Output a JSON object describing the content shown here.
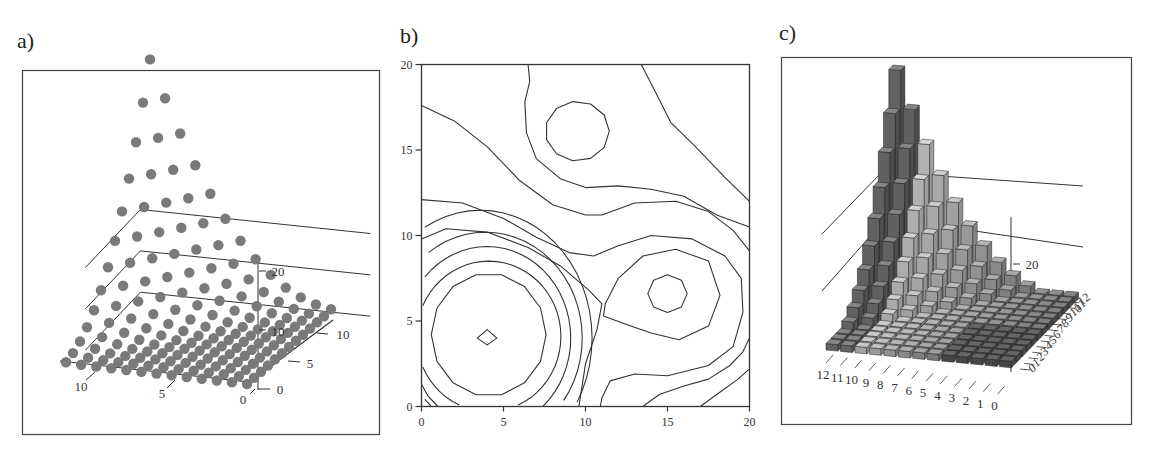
{
  "panels": {
    "a": {
      "label": "a)"
    },
    "b": {
      "label": "b)"
    },
    "c": {
      "label": "c)"
    }
  },
  "colors": {
    "frame": "#444444",
    "axis_line": "#333333",
    "dot": "#7a7a7a",
    "contour": "#333333",
    "bar_dark": "#6e6e6e",
    "bar_light": "#e6e6e6",
    "bar_floor": "#3a3a3a"
  },
  "chart_data": [
    {
      "id": "a",
      "type": "scatter",
      "subtype": "3d-scatter",
      "title": "a)",
      "xlabel": "",
      "ylabel": "",
      "zlabel": "",
      "x_ticks": [
        "0",
        "5",
        "10"
      ],
      "y_ticks": [
        "0",
        "5",
        "10"
      ],
      "z_ticks": [
        "10",
        "20"
      ],
      "grid_size": [
        13,
        13
      ],
      "description": "13x13 grid of points on the floor plane; heights rise toward the far-left corner (max ≈ 30 at corner)",
      "xlim": [
        0,
        12
      ],
      "ylim": [
        0,
        12
      ],
      "zlim": [
        0,
        30
      ]
    },
    {
      "id": "b",
      "type": "contour",
      "title": "b)",
      "xlabel": "",
      "ylabel": "",
      "x_ticks": [
        "0",
        "5",
        "10",
        "15",
        "20"
      ],
      "y_ticks": [
        "0",
        "5",
        "10",
        "15",
        "20"
      ],
      "xlim": [
        0,
        20
      ],
      "ylim": [
        0,
        20
      ],
      "features": [
        {
          "kind": "peak",
          "x": 4,
          "y": 4,
          "rings": 7
        },
        {
          "kind": "peak",
          "x": 15,
          "y": 6.5,
          "rings": 3
        },
        {
          "kind": "closed-contour",
          "x": 9.5,
          "y": 16
        }
      ]
    },
    {
      "id": "c",
      "type": "bar",
      "subtype": "3d-bar",
      "title": "c)",
      "xlabel": "",
      "ylabel": "",
      "zlabel": "",
      "x_ticks": [
        "12",
        "11",
        "10",
        "9",
        "8",
        "7",
        "6",
        "5",
        "4",
        "3",
        "2",
        "1",
        "0"
      ],
      "y_ticks": [
        "0",
        "1",
        "2",
        "3",
        "4",
        "5",
        "6",
        "7",
        "8",
        "9",
        "10",
        "11",
        "12"
      ],
      "z_ticks": [
        "20"
      ],
      "grid_size": [
        13,
        13
      ],
      "description": "13x13 grid of 3D bars; heights rise toward the far-left corner (max ≈ 40)",
      "zlim": [
        0,
        40
      ]
    }
  ]
}
